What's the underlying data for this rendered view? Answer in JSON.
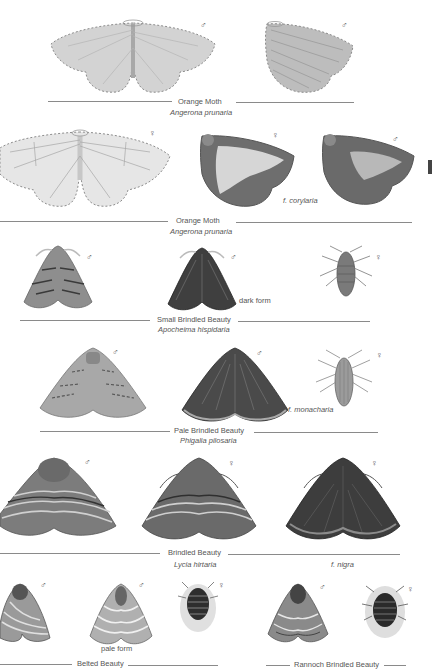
{
  "plates": [
    {
      "common_name": "Orange Moth",
      "scientific_name": "Angerona prunaria",
      "specimens": [
        {
          "sex": "♂",
          "form": "",
          "view": "spread"
        },
        {
          "sex": "♂",
          "form": "",
          "view": "side"
        }
      ]
    },
    {
      "common_name": "Orange Moth",
      "scientific_name": "Angerona prunaria",
      "specimens": [
        {
          "sex": "♀",
          "form": "",
          "view": "spread"
        },
        {
          "sex": "♀",
          "form": "f. corylaria",
          "view": "side"
        },
        {
          "sex": "♂",
          "form": "",
          "view": "side"
        }
      ],
      "form_label": "f. corylaria"
    },
    {
      "common_name": "Small Brindled Beauty",
      "scientific_name": "Apocheima hispidaria",
      "specimens": [
        {
          "sex": "♂",
          "form": "",
          "view": "rest"
        },
        {
          "sex": "♂",
          "form": "dark form",
          "view": "rest"
        },
        {
          "sex": "♀",
          "form": "",
          "view": "wingless"
        }
      ],
      "form_label": "dark form"
    },
    {
      "common_name": "Pale Brindled Beauty",
      "scientific_name": "Phigalia pilosaria",
      "specimens": [
        {
          "sex": "♂",
          "form": "",
          "view": "rest"
        },
        {
          "sex": "♂",
          "form": "f. monacharia",
          "view": "rest"
        },
        {
          "sex": "♀",
          "form": "",
          "view": "wingless"
        }
      ],
      "form_label": "f. monacharia"
    },
    {
      "common_name": "Brindled Beauty",
      "scientific_name": "Lycia hirtaria",
      "specimens": [
        {
          "sex": "♂",
          "form": "",
          "view": "rest"
        },
        {
          "sex": "♀",
          "form": "",
          "view": "rest"
        },
        {
          "sex": "♀",
          "form": "f. nigra",
          "view": "rest"
        }
      ],
      "form_label": "f. nigra"
    },
    {
      "common_name": "Belted Beauty",
      "scientific_name": "",
      "specimens": [
        {
          "sex": "♂",
          "form": "",
          "view": "rest"
        },
        {
          "sex": "♂",
          "form": "pale form",
          "view": "rest"
        },
        {
          "sex": "♀",
          "form": "",
          "view": "wingless"
        }
      ],
      "form_label": "pale form"
    },
    {
      "common_name": "Rannoch Brindled Beauty",
      "scientific_name": "",
      "specimens": [
        {
          "sex": "♂",
          "form": "",
          "view": "rest"
        },
        {
          "sex": "♀",
          "form": "",
          "view": "wingless"
        }
      ]
    }
  ],
  "colors": {
    "background": "#ffffff",
    "orange_pale": "#d9d9d9",
    "orange_dark": "#6b6b6b",
    "brindled": "#5a5a5a",
    "rule": "#8a8a8a"
  }
}
